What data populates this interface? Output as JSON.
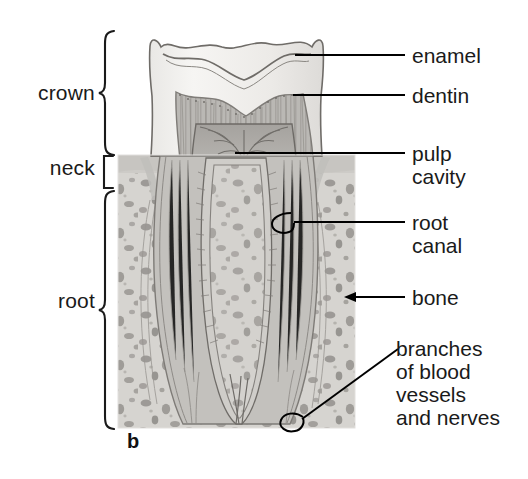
{
  "figure": {
    "letter": "b",
    "style": "grayscale-pencil-illustration"
  },
  "palette": {
    "ink": "#1a1a1a",
    "leader_line": "#000000",
    "bone_field": "#d4d2ce",
    "bone_speck": "#8e8b87",
    "enamel": "#f2f1ee",
    "enamel_outline": "#6f6c68",
    "dentin": "#b9b7b3",
    "dentin_stripe": "#8d8a86",
    "pulp": "#a3a09c",
    "gum": "#cfcdc9",
    "background": "#ffffff"
  },
  "region_labels": [
    {
      "id": "crown",
      "text": "crown",
      "bracket": "curly",
      "span_top": 33,
      "span_bottom": 150
    },
    {
      "id": "neck",
      "text": "neck",
      "bracket": "square",
      "span_top": 157,
      "span_bottom": 185
    },
    {
      "id": "root",
      "text": "root",
      "bracket": "curly",
      "span_top": 192,
      "span_bottom": 428
    }
  ],
  "callouts": [
    {
      "id": "enamel",
      "lines": [
        "enamel"
      ],
      "leader": "straight",
      "pointer_x": 295,
      "pointer_y": 55
    },
    {
      "id": "dentin",
      "lines": [
        "dentin"
      ],
      "leader": "straight",
      "pointer_x": 293,
      "pointer_y": 95
    },
    {
      "id": "pulp-cavity",
      "lines": [
        "pulp",
        "cavity"
      ],
      "leader": "straight",
      "pointer_x": 235,
      "pointer_y": 153
    },
    {
      "id": "root-canal",
      "lines": [
        "root",
        "canal"
      ],
      "leader": "hooked",
      "pointer_x": 280,
      "pointer_y": 222
    },
    {
      "id": "bone",
      "lines": [
        "bone"
      ],
      "leader": "arrow",
      "pointer_x": 345,
      "pointer_y": 297
    },
    {
      "id": "branches-of-blood-vessels-and-nerves",
      "lines": [
        "branches",
        "of blood",
        "vessels",
        "and nerves"
      ],
      "leader": "diagonal-hooked",
      "pointer_x": 292,
      "pointer_y": 424
    }
  ]
}
